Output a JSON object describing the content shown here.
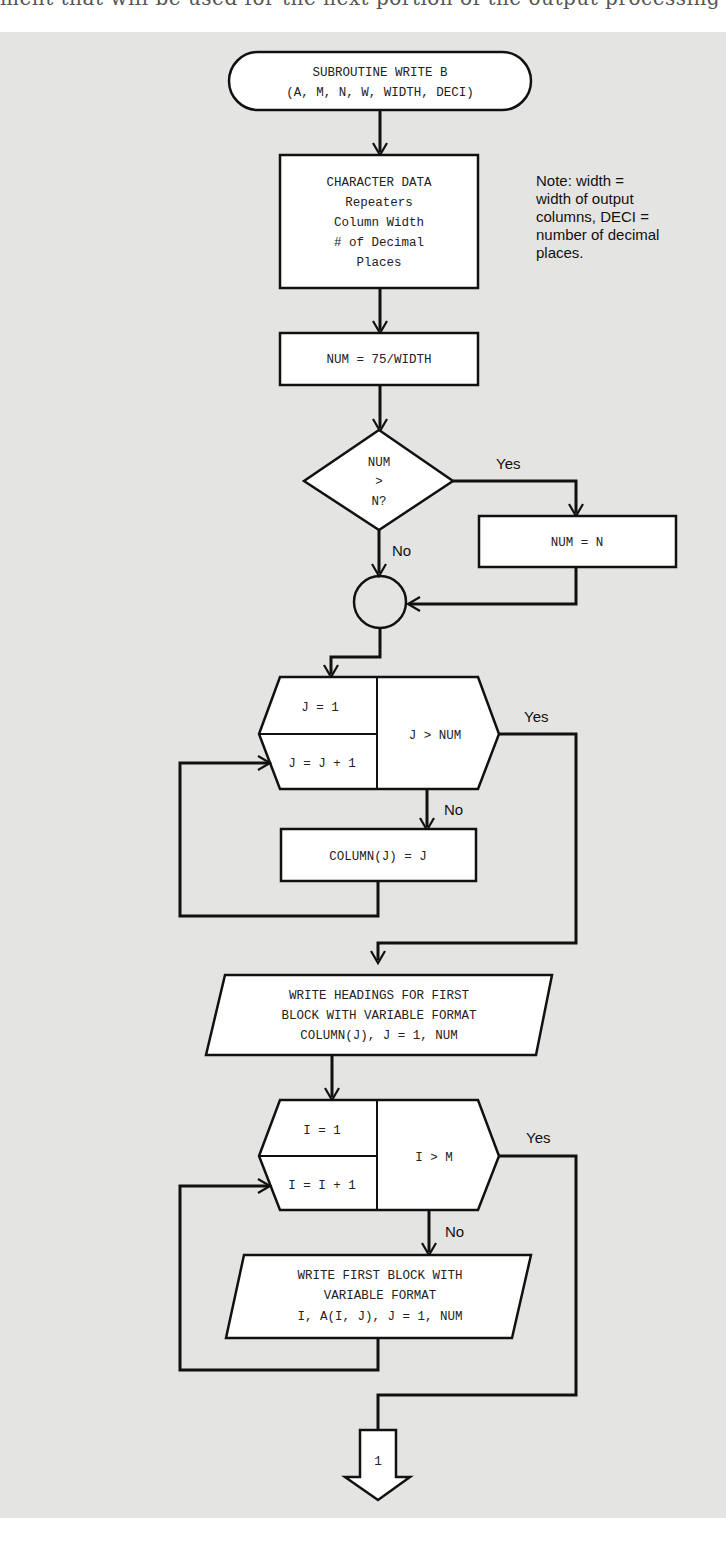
{
  "page": {
    "cut_off_header_text": "ment that will be used for the next portion of the output processing generally"
  },
  "flowchart": {
    "start": {
      "line1": "SUBROUTINE WRITE B",
      "line2": "(A, M, N, W, WIDTH, DECI)"
    },
    "character_data": {
      "line1": "CHARACTER DATA",
      "line2": "Repeaters",
      "line3": "Column Width",
      "line4": "# of Decimal",
      "line5": "Places"
    },
    "note": {
      "line1": "Note: width =",
      "line2": "width of output",
      "line3": "columns, DECI =",
      "line4": "number of decimal",
      "line5": "places."
    },
    "num_assign": "NUM = 75/WIDTH",
    "decision": {
      "line1": "NUM",
      "line2": ">",
      "line3": "N?",
      "yes_label": "Yes",
      "no_label": "No"
    },
    "num_eq_n": "NUM = N",
    "loop_j": {
      "init": "J = 1",
      "increment": "J = J + 1",
      "test": "J > NUM",
      "yes_label": "Yes",
      "no_label": "No"
    },
    "column_assign": "COLUMN(J) = J",
    "write_headings": {
      "line1": "WRITE HEADINGS FOR FIRST",
      "line2": "BLOCK WITH VARIABLE FORMAT",
      "line3": "COLUMN(J), J = 1, NUM"
    },
    "loop_i": {
      "init": "I = 1",
      "increment": "I = I + 1",
      "test": "I > M",
      "yes_label": "Yes",
      "no_label": "No"
    },
    "write_block": {
      "line1": "WRITE FIRST BLOCK WITH",
      "line2": "VARIABLE FORMAT",
      "line3": "I, A(I, J), J = 1, NUM"
    },
    "offpage_connector": "1"
  },
  "colors": {
    "panel_bg": "#e4e4e2",
    "shape_fill": "#ffffff",
    "stroke": "#111111"
  }
}
